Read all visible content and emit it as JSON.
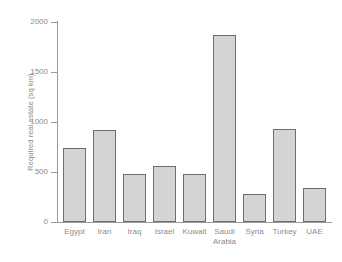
{
  "chart_data": {
    "type": "bar",
    "title": "",
    "subtitle": "",
    "xlabel": "",
    "ylabel": "Required real estate (sq km)",
    "categories": [
      "Egypt",
      "Iran",
      "Iraq",
      "Israel",
      "Kuwait",
      "Saudi Arabia",
      "Syria",
      "Turkey",
      "UAE"
    ],
    "values": [
      745,
      925,
      480,
      560,
      480,
      1875,
      280,
      935,
      340
    ],
    "ylim": [
      0,
      2000
    ],
    "yticks": [
      0,
      500,
      1000,
      1500,
      2000
    ],
    "ytick_labels": [
      "0",
      "500",
      "1000",
      "1500",
      "2000"
    ],
    "grid": false,
    "legend": null,
    "annotations": []
  },
  "axes": {
    "y_title": "Required real estate (sq km)",
    "y_tick_labels": [
      "2000",
      "1500",
      "1000",
      "500",
      "0"
    ],
    "x_tick_labels": [
      "Egypt",
      "Iran",
      "Iraq",
      "Israel",
      "Kuwait",
      "Saudi\nArabia",
      "Syria",
      "Turkey",
      "UAE"
    ]
  },
  "style": {
    "bar_fill": "#d4d4d4",
    "bar_stroke": "#6e6e6e",
    "axis_color": "#9a9a9a",
    "text_color": "#8c8c8c",
    "background": "#ffffff"
  }
}
